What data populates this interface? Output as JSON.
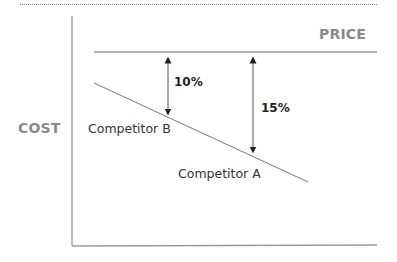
{
  "diagram": {
    "title": "",
    "y_axis_label": "COST",
    "price_label": "PRICE",
    "series": [
      {
        "name": "Competitor B",
        "position": "higher cost (upper left)"
      },
      {
        "name": "Competitor A",
        "position": "lower cost (lower right)"
      }
    ],
    "margins": [
      {
        "label": "10%",
        "between": "Price and Competitor B"
      },
      {
        "label": "15%",
        "between": "Price and Competitor A"
      }
    ],
    "colors": {
      "axis": "#9a9a9a",
      "price_line": "#9a9a9a",
      "cost_line": "#777777",
      "arrow": "#222222",
      "axis_title": "#8a8a8a"
    }
  }
}
